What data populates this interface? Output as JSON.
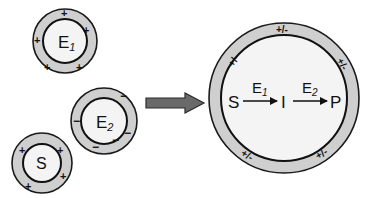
{
  "diagram": {
    "type": "enzyme-compartmentalization",
    "colors": {
      "ring_fill": "#cfcfcf",
      "core_fill": "#f4f4f4",
      "stroke": "#111111",
      "block_arrow_fill": "#6a6a6a"
    },
    "particles": [
      {
        "id": "e1",
        "label_main": "E",
        "label_sub": "1",
        "charge_symbol": "+",
        "charge_count": 5
      },
      {
        "id": "e2",
        "label_main": "E",
        "label_sub": "2",
        "charge_symbol": "−",
        "charge_count": 5
      },
      {
        "id": "s",
        "label_main": "S",
        "label_sub": "",
        "charge_symbol": "+",
        "charge_count": 4
      }
    ],
    "transition_arrow": "block-arrow-right",
    "compartment": {
      "charge_symbol": "+/-",
      "charge_count": 6,
      "reaction": {
        "substrate": "S",
        "intermediate": "I",
        "product": "P",
        "enzyme1_main": "E",
        "enzyme1_sub": "1",
        "enzyme2_main": "E",
        "enzyme2_sub": "2"
      }
    }
  }
}
